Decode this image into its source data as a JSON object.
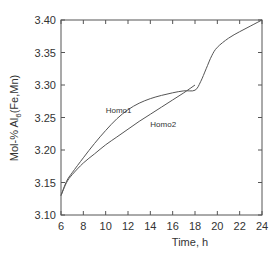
{
  "chart_data": {
    "type": "line",
    "title": "",
    "xlabel": "Time, h",
    "ylabel": "Mol-% Al6(Fe,Mn)",
    "ylabel_parts": {
      "pre": "Mol-% Al",
      "sub": "6",
      "post": "(Fe,Mn)"
    },
    "xlim": [
      6,
      24
    ],
    "ylim": [
      3.1,
      3.4
    ],
    "xticks": [
      6,
      8,
      10,
      12,
      14,
      16,
      18,
      20,
      22,
      24
    ],
    "xtick_labels": [
      "6",
      "8",
      "10",
      "12",
      "14",
      "16",
      "18",
      "20",
      "22",
      "24"
    ],
    "yticks": [
      3.1,
      3.15,
      3.2,
      3.25,
      3.3,
      3.35,
      3.4
    ],
    "ytick_labels": [
      "3.10",
      "3.15",
      "3.20",
      "3.25",
      "3.30",
      "3.35",
      "3.40"
    ],
    "grid": false,
    "legend": "none (inline annotations)",
    "series": [
      {
        "name": "Homo1",
        "x": [
          6.0,
          6.5,
          7.0,
          8.0,
          9.0,
          10.0,
          11.0,
          12.0,
          13.0,
          14.0,
          15.0,
          16.0,
          17.0,
          18.0,
          18.5,
          19.0,
          19.5,
          20.0,
          21.0,
          22.0,
          23.0,
          24.0
        ],
        "y": [
          3.13,
          3.152,
          3.165,
          3.188,
          3.21,
          3.23,
          3.248,
          3.262,
          3.272,
          3.279,
          3.284,
          3.288,
          3.291,
          3.292,
          3.305,
          3.325,
          3.345,
          3.358,
          3.372,
          3.382,
          3.391,
          3.4
        ]
      },
      {
        "name": "Homo2",
        "x": [
          6.0,
          6.5,
          7.0,
          8.0,
          9.0,
          10.0,
          11.0,
          12.0,
          13.0,
          14.0,
          15.0,
          16.0,
          17.0,
          18.0
        ],
        "y": [
          3.13,
          3.15,
          3.162,
          3.18,
          3.194,
          3.208,
          3.22,
          3.232,
          3.244,
          3.255,
          3.266,
          3.277,
          3.288,
          3.3
        ]
      }
    ],
    "annotations": [
      {
        "text": "Homo1",
        "x": 10.0,
        "y": 3.257
      },
      {
        "text": "Homo2",
        "x": 14.0,
        "y": 3.236
      }
    ]
  }
}
